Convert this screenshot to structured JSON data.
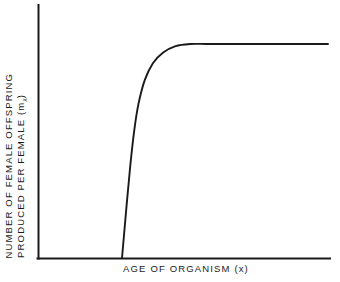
{
  "figure": {
    "background_color": "#ffffff",
    "ink_color": "#1a1a1a"
  },
  "axes": {
    "x_title": "AGE OF ORGANISM (x)",
    "y_title_line_1": "NUMBER OF FEMALE OFFSPRING",
    "y_title_line_2_prefix": "PRODUCED PER FEMALE (m",
    "y_title_line_2_subscript": "x",
    "y_title_line_2_suffix": ")"
  },
  "chart_data": {
    "type": "line",
    "title": "",
    "subtitle": "",
    "xlabel": "AGE OF ORGANISM (x)",
    "ylabel": "NUMBER OF FEMALE OFFSPRING PRODUCED PER FEMALE (mx)",
    "grid": false,
    "legend": null,
    "axis_ticks": {
      "x": [],
      "y": []
    },
    "xlim": [
      0,
      1
    ],
    "ylim": [
      0,
      1
    ],
    "series": [
      {
        "name": "fecundity",
        "color": "#1a1a1a",
        "x": [
          0.0,
          0.02,
          0.04,
          0.06,
          0.08,
          0.11,
          0.15,
          0.2,
          0.26,
          0.33,
          0.41,
          0.5,
          0.62,
          0.75,
          0.88,
          1.0
        ],
        "y": [
          0.0,
          0.22,
          0.43,
          0.6,
          0.72,
          0.83,
          0.91,
          0.96,
          0.99,
          1.0,
          1.0,
          1.0,
          1.0,
          1.0,
          1.0,
          1.0
        ]
      }
    ]
  }
}
